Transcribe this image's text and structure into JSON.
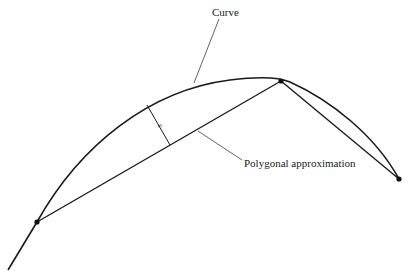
{
  "diagram": {
    "labels": {
      "curve": "Curve",
      "polygon": "Polygonal approximation",
      "epsilon": "ε"
    },
    "colors": {
      "stroke": "#1a1a1a",
      "leader": "#3a3a3a",
      "background": "#ffffff"
    },
    "vertices": [
      {
        "name": "left",
        "x": 37,
        "y": 222
      },
      {
        "name": "top",
        "x": 281,
        "y": 81
      },
      {
        "name": "right",
        "x": 399,
        "y": 179
      }
    ]
  }
}
